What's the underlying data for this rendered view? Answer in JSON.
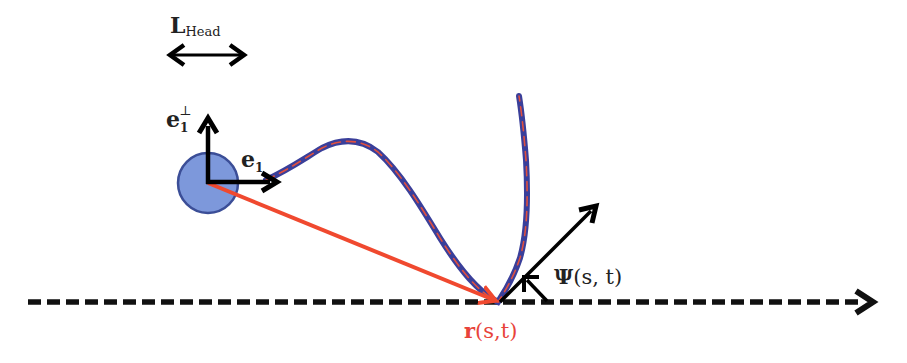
{
  "diagram": {
    "labels": {
      "head_length": {
        "main": "L",
        "sub": "Head"
      },
      "e1_perp": {
        "main": "e",
        "sub": "1",
        "sup": "⊥"
      },
      "e1": {
        "main": "e",
        "sub": "1"
      },
      "psi": {
        "main": "Ψ",
        "args": "(s, t)"
      },
      "r": {
        "main": "r",
        "args": "(s,t)"
      }
    },
    "colors": {
      "head_fill": "#7390d8",
      "head_stroke": "#2b3f8f",
      "flagellum_outer": "#3a3f9a",
      "flagellum_inner": "#e0503f",
      "position_vector": "#f0492f",
      "frame_vectors": "#000000",
      "axis": "#111111",
      "r_label": "#e8433a"
    },
    "elements": [
      "head-length-double-arrow",
      "head-circle",
      "e1-perp-arrow",
      "e1-arrow",
      "flagellum-curve",
      "position-vector-r",
      "tangent-arrow-psi",
      "angle-marker-psi",
      "reference-axis-dashed"
    ]
  }
}
